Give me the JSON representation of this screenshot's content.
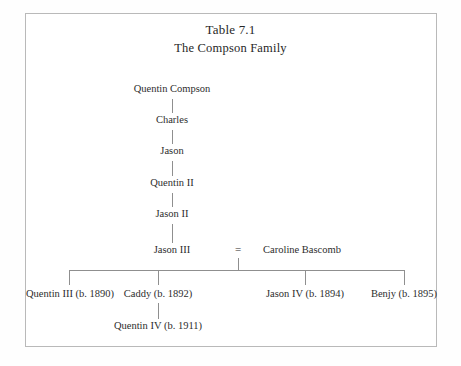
{
  "figure": {
    "title": "Table 7.1",
    "subtitle": "The Compson Family",
    "equals_symbol": "=",
    "frame_color": "#b9b9b9",
    "line_color": "#8f8f8f",
    "text_color": "#2d2d2d",
    "background": "#ffffff"
  },
  "lineage": [
    {
      "name": "Quentin Compson"
    },
    {
      "name": "Charles"
    },
    {
      "name": "Jason"
    },
    {
      "name": "Quentin II"
    },
    {
      "name": "Jason II"
    },
    {
      "name": "Jason III"
    }
  ],
  "spouse": {
    "name": "Caroline Bascomb"
  },
  "children": [
    {
      "name": "Quentin III (b. 1890)"
    },
    {
      "name": "Caddy (b. 1892)"
    },
    {
      "name": "Jason IV (b. 1894)"
    },
    {
      "name": "Benjy (b. 1895)"
    }
  ],
  "grandchild": {
    "name": "Quentin IV (b. 1911)"
  }
}
